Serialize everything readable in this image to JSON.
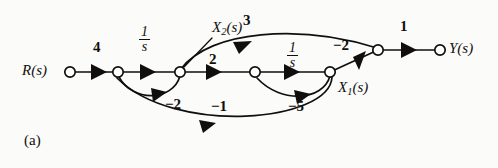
{
  "figure": {
    "panel_label": "(a)",
    "kind": "signal-flow-graph"
  },
  "nodes": [
    {
      "id": "R",
      "label": "R(s)",
      "label_plain": "R",
      "label_sub": "",
      "x": 70,
      "y": 72
    },
    {
      "id": "n2",
      "label": "",
      "x": 118,
      "y": 72
    },
    {
      "id": "X2",
      "label": "X2(s)",
      "label_plain": "X",
      "label_sub": "2",
      "x": 180,
      "y": 72
    },
    {
      "id": "n4",
      "label": "",
      "x": 255,
      "y": 72
    },
    {
      "id": "X1",
      "label": "X1(s)",
      "label_plain": "X",
      "label_sub": "1",
      "x": 330,
      "y": 72
    },
    {
      "id": "n6",
      "label": "",
      "x": 378,
      "y": 50
    },
    {
      "id": "Y",
      "label": "Y(s)",
      "label_plain": "Y",
      "label_sub": "",
      "x": 440,
      "y": 50
    }
  ],
  "edges": [
    {
      "from": "R",
      "to": "n2",
      "gain": "4",
      "type": "forward"
    },
    {
      "from": "n2",
      "to": "X2",
      "gain": "1/s",
      "gain_num": "1",
      "gain_den": "s",
      "type": "forward"
    },
    {
      "from": "X2",
      "to": "n4",
      "gain": "2",
      "type": "forward"
    },
    {
      "from": "n4",
      "to": "X1",
      "gain": "1/s",
      "gain_num": "1",
      "gain_den": "s",
      "type": "forward"
    },
    {
      "from": "X2",
      "to": "n6",
      "gain": "3",
      "type": "feedforward-curve"
    },
    {
      "from": "n6",
      "to": "Y",
      "gain": "1",
      "type": "forward"
    },
    {
      "from": "n6",
      "to": "X1",
      "gain": "-2",
      "type": "feedback-straight"
    },
    {
      "from": "X2",
      "to": "n2",
      "gain": "-2",
      "type": "feedback-loop"
    },
    {
      "from": "X1",
      "to": "n4",
      "gain": "-5",
      "type": "feedback-loop"
    },
    {
      "from": "X1",
      "to": "n2",
      "gain": "-1",
      "type": "feedback-loop-outer"
    }
  ],
  "labels": {
    "input": "R(s)",
    "input_var": "R",
    "output": "Y(s)",
    "output_var": "Y",
    "state1_var": "X",
    "state1_sub": "1",
    "state2_var": "X",
    "state2_sub": "2",
    "paren_s": "(s)",
    "gain_4": "4",
    "gain_2": "2",
    "gain_3": "3",
    "gain_1": "1",
    "gain_neg2_top": "−2",
    "gain_neg2_loop": "−2",
    "gain_neg1": "−1",
    "gain_neg5": "−5",
    "integrator_num": "1",
    "integrator_den": "s",
    "panel": "(a)"
  },
  "colors": {
    "stroke": "#100f0d",
    "node_fill": "#ffffff",
    "background": "#fbfbf9"
  }
}
